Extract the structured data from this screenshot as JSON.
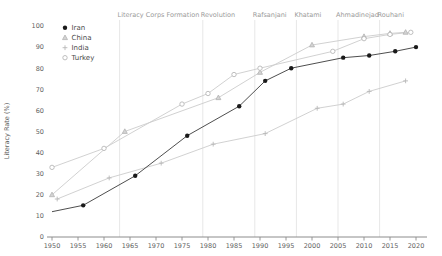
{
  "chart_data": {
    "type": "line",
    "title": "",
    "xlabel": "",
    "ylabel": "Literacy Rate (%)",
    "xlim": [
      1950,
      2020
    ],
    "ylim": [
      0,
      100
    ],
    "x_ticks": [
      1950,
      1955,
      1960,
      1965,
      1970,
      1975,
      1980,
      1985,
      1990,
      1995,
      2000,
      2005,
      2010,
      2015,
      2020
    ],
    "y_ticks": [
      0,
      10,
      20,
      30,
      40,
      50,
      60,
      70,
      80,
      90,
      100
    ],
    "grid": "vertical lines at annotation years only",
    "legend_position": "top-left inside plot",
    "legend_entries": [
      "Iran",
      "China",
      "India",
      "Turkey"
    ],
    "series": [
      {
        "name": "Iran",
        "marker": "filled-circle",
        "color": "#1a1a1a",
        "line_color": "#3a3a3a",
        "points": [
          [
            1950,
            12
          ],
          [
            1956,
            15
          ],
          [
            1966,
            29
          ],
          [
            1976,
            48
          ],
          [
            1986,
            62
          ],
          [
            1991,
            74
          ],
          [
            1996,
            80
          ],
          [
            2006,
            85
          ],
          [
            2011,
            86
          ],
          [
            2016,
            88
          ],
          [
            2020,
            90
          ]
        ],
        "first_point_unmarked": true
      },
      {
        "name": "China",
        "marker": "triangle",
        "color": "#b2b2b2",
        "line_color": "#cccccc",
        "points": [
          [
            1950,
            20
          ],
          [
            1964,
            50
          ],
          [
            1982,
            66
          ],
          [
            1990,
            78
          ],
          [
            2000,
            91
          ],
          [
            2010,
            95
          ],
          [
            2015,
            96.5
          ],
          [
            2018,
            97
          ]
        ],
        "first_point_unmarked": false
      },
      {
        "name": "India",
        "marker": "plus",
        "color": "#b8b8b8",
        "line_color": "#cccccc",
        "points": [
          [
            1951,
            18
          ],
          [
            1961,
            28
          ],
          [
            1971,
            35
          ],
          [
            1981,
            44
          ],
          [
            1991,
            49
          ],
          [
            2001,
            61
          ],
          [
            2006,
            63
          ],
          [
            2011,
            69
          ],
          [
            2018,
            74
          ]
        ],
        "first_point_unmarked": false
      },
      {
        "name": "Turkey",
        "marker": "open-circle",
        "color": "#b8b8b8",
        "line_color": "#cccccc",
        "points": [
          [
            1950,
            33
          ],
          [
            1960,
            42
          ],
          [
            1975,
            63
          ],
          [
            1980,
            68
          ],
          [
            1985,
            77
          ],
          [
            1990,
            80
          ],
          [
            2004,
            88
          ],
          [
            2010,
            94
          ],
          [
            2015,
            96
          ],
          [
            2019,
            97
          ]
        ],
        "first_point_unmarked": false
      }
    ],
    "annotations": [
      {
        "year": 1963,
        "label": "Literacy Corps Formation"
      },
      {
        "year": 1979,
        "label": "Revolution"
      },
      {
        "year": 1989,
        "label": "Rafsanjani"
      },
      {
        "year": 1997,
        "label": "Khatami"
      },
      {
        "year": 2005,
        "label": "Ahmadinejad"
      },
      {
        "year": 2013,
        "label": "Rouhani"
      }
    ],
    "colors": {
      "axis": "#8c8c8c",
      "tick_label": "#5f5f5f",
      "annotation_text": "#9a9a9a",
      "event_gridline": "#e7e7e7",
      "legend_text": "#4a4a4a",
      "background": "#ffffff"
    }
  }
}
